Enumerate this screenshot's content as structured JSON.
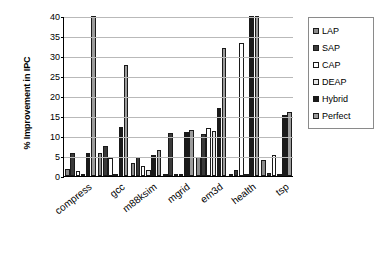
{
  "chart_data": {
    "type": "bar",
    "title": "",
    "xlabel": "",
    "ylabel": "% Improvement in IPC",
    "ylim": [
      0,
      40
    ],
    "yticks": [
      0,
      5,
      10,
      15,
      20,
      25,
      30,
      35,
      40
    ],
    "grid": true,
    "legend_position": "right",
    "categories": [
      "compress",
      "gcc",
      "m88ksim",
      "mgrid",
      "em3d",
      "health",
      "tsp"
    ],
    "series": [
      {
        "name": "LAP",
        "color": "#8c8c8c",
        "values": [
          1.8,
          5.8,
          3.3,
          0.5,
          4.8,
          0.0,
          3.9
        ]
      },
      {
        "name": "SAP",
        "color": "#3a3a3a",
        "values": [
          5.7,
          7.5,
          4.8,
          10.7,
          10.4,
          1.4,
          0.7
        ]
      },
      {
        "name": "CAP",
        "color": "#ffffff",
        "values": [
          1.3,
          4.4,
          2.5,
          0.6,
          11.9,
          33.3,
          5.3
        ]
      },
      {
        "name": "DEAP",
        "color": "#e6e6e6",
        "values": [
          0.3,
          0.2,
          1.5,
          0.4,
          11.2,
          0.0,
          0.2
        ]
      },
      {
        "name": "Hybrid",
        "color": "#1a1a1a",
        "values": [
          5.8,
          12.2,
          5.3,
          11.0,
          16.9,
          40.0,
          15.2
        ]
      },
      {
        "name": "Perfect",
        "color": "#9b9b9b",
        "values": [
          40.0,
          27.8,
          6.4,
          11.6,
          32.1,
          40.0,
          16.1
        ]
      }
    ]
  },
  "axis": {
    "y_title": "% Improvement in IPC"
  },
  "legend": {
    "items": [
      {
        "label": "LAP"
      },
      {
        "label": "SAP"
      },
      {
        "label": "CAP"
      },
      {
        "label": "DEAP"
      },
      {
        "label": "Hybrid"
      },
      {
        "label": "Perfect"
      }
    ]
  }
}
